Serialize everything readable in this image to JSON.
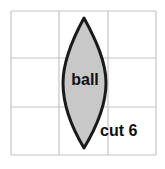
{
  "diagram": {
    "background_color": "#ffffff",
    "grid": {
      "name": "layout-grid",
      "columns": 3,
      "rows": 3,
      "line_color": "#c4c4c4",
      "left": 11,
      "top": 11,
      "right": 156,
      "bottom": 155,
      "vertical_lines": [
        11,
        59,
        108,
        156
      ],
      "horizontal_lines": [
        11,
        58,
        107,
        155
      ]
    },
    "shape": {
      "name": "ball-lens-shape",
      "type": "lens",
      "fill_color": "#c8c8c8",
      "stroke_color": "#1a1a1a",
      "stroke_width": 3,
      "top_point": {
        "x": 84,
        "y": 18
      },
      "bottom_point": {
        "x": 84,
        "y": 148
      },
      "left_point": {
        "x": 63,
        "y": 83
      },
      "right_point": {
        "x": 106,
        "y": 83
      }
    },
    "labels": {
      "ball": {
        "text": "ball",
        "x": 85,
        "y": 85,
        "color": "#111111",
        "bold": true
      },
      "cut": {
        "text": "cut 6",
        "x": 100,
        "y": 136,
        "color": "#111111",
        "bold": true
      }
    }
  }
}
